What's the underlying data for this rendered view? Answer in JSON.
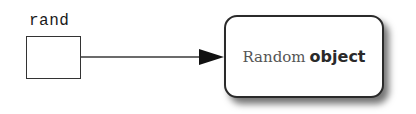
{
  "diagram": {
    "type": "reference-diagram",
    "variable": {
      "name": "rand",
      "box": "empty reference cell"
    },
    "arrow": {
      "from": "rand",
      "to": "object",
      "style": "solid line with filled triangular arrowhead"
    },
    "object": {
      "label_part1": "Random",
      "label_part2": "object",
      "shape": "rounded rectangle with drop shadow"
    },
    "colors": {
      "stroke": "#2a2a2a",
      "background": "#ffffff",
      "label_part1": "#555555",
      "label_part2": "#2a2a2a"
    }
  }
}
